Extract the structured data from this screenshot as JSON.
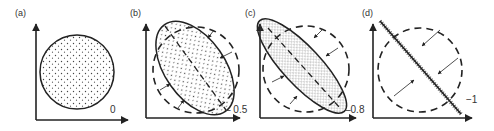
{
  "figure": {
    "panels": [
      {
        "label": "(a)",
        "correlation": "0",
        "shape": "circle"
      },
      {
        "label": "(b)",
        "correlation": "0.5",
        "shape": "ellipse"
      },
      {
        "label": "(c)",
        "correlation": "0.8",
        "shape": "narrow-ellipse"
      },
      {
        "label": "(d)",
        "correlation": "−1",
        "shape": "line"
      }
    ]
  },
  "colors": {
    "ink": "#222222",
    "background": "#ffffff"
  }
}
